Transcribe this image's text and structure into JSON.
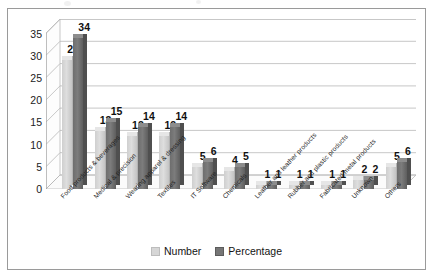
{
  "chart_data": {
    "type": "bar",
    "title": "",
    "subtitle": "",
    "xlabel": "",
    "ylabel": "",
    "ylim": [
      0,
      35
    ],
    "yticks": [
      0,
      5,
      10,
      15,
      20,
      25,
      30,
      35
    ],
    "grid": true,
    "three_d": true,
    "legend_position": "bottom",
    "categories": [
      "Food products & beverages",
      "Medical & precision",
      "Wearing apparel & dressing",
      "Textiles",
      "IT Software",
      "Chemicals",
      "Leather and leather products",
      "Rubber and plastic products",
      "Fabricated metal products",
      "Unknown",
      "Others"
    ],
    "series": [
      {
        "name": "Number",
        "color": "#d6d6d6",
        "values": [
          29,
          13,
          12,
          12,
          5,
          4,
          1,
          1,
          1,
          2,
          5
        ]
      },
      {
        "name": "Percentage",
        "color": "#767676",
        "values": [
          34,
          15,
          14,
          14,
          6,
          5,
          1,
          1,
          1,
          2,
          6
        ]
      }
    ]
  },
  "legend": {
    "items": [
      {
        "label": "Number"
      },
      {
        "label": "Percentage"
      }
    ]
  },
  "colors": {
    "number_series": "#d6d6d6",
    "percentage_series": "#767676",
    "frame": "#9a9a9a",
    "gridline": "#b9b9b9",
    "text": "#1b1b1b"
  }
}
